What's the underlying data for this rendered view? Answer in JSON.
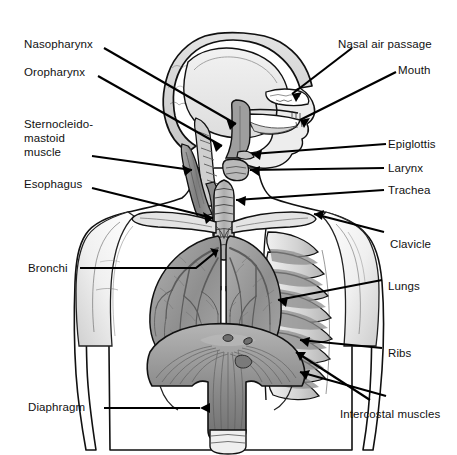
{
  "diagram": {
    "type": "anatomical-illustration",
    "background_color": "#ffffff",
    "line_color": "#000000",
    "width": 457,
    "height": 455
  },
  "labels": {
    "left": [
      {
        "id": "nasopharynx",
        "text": "Nasopharynx",
        "x": 24,
        "y": 38,
        "leader": "diagonal-down-right"
      },
      {
        "id": "oropharynx",
        "text": "Oropharynx",
        "x": 24,
        "y": 66,
        "leader": "diagonal-down-right"
      },
      {
        "id": "sternocleidomastoid",
        "text": "Sternocleido-mastoid muscle",
        "x": 24,
        "y": 117,
        "leader": "horizontal-right",
        "lines": [
          "Sternocleido-",
          "mastoid",
          "muscle"
        ]
      },
      {
        "id": "esophagus",
        "text": "Esophagus",
        "x": 24,
        "y": 178,
        "leader": "horizontal-right"
      },
      {
        "id": "bronchi",
        "text": "Bronchi",
        "x": 28,
        "y": 262,
        "leader": "horizontal-right"
      },
      {
        "id": "diaphragm",
        "text": "Diaphragm",
        "x": 28,
        "y": 401,
        "leader": "horizontal-right"
      }
    ],
    "right": [
      {
        "id": "nasal-air-passage",
        "text": "Nasal air passage",
        "x": 338,
        "y": 38,
        "leader": "diagonal-down-left"
      },
      {
        "id": "mouth",
        "text": "Mouth",
        "x": 398,
        "y": 64,
        "leader": "diagonal-down-left"
      },
      {
        "id": "epiglottis",
        "text": "Epiglottis",
        "x": 388,
        "y": 138,
        "leader": "horizontal-left"
      },
      {
        "id": "larynx",
        "text": "Larynx",
        "x": 388,
        "y": 162,
        "leader": "horizontal-left"
      },
      {
        "id": "trachea",
        "text": "Trachea",
        "x": 388,
        "y": 184,
        "leader": "horizontal-left"
      },
      {
        "id": "clavicle",
        "text": "Clavicle",
        "x": 390,
        "y": 238,
        "leader": "diagonal-up-left"
      },
      {
        "id": "lungs",
        "text": "Lungs",
        "x": 388,
        "y": 280,
        "leader": "horizontal-left"
      },
      {
        "id": "ribs",
        "text": "Ribs",
        "x": 388,
        "y": 347,
        "leader": "horizontal-left"
      },
      {
        "id": "intercostal-muscles",
        "text": "Intercostal muscles",
        "x": 340,
        "y": 408,
        "leader": "diagonal-up-left"
      }
    ]
  },
  "structures": [
    {
      "name": "skull",
      "tone": "#d9d9d9"
    },
    {
      "name": "cranial-cavity",
      "tone": "#e8e8e8"
    },
    {
      "name": "nasal-cavity",
      "tone": "#ffffff"
    },
    {
      "name": "oral-cavity",
      "tone": "#ffffff"
    },
    {
      "name": "pharynx",
      "tone": "#9e9e9e"
    },
    {
      "name": "vertebrae",
      "tone": "#cfcfcf"
    },
    {
      "name": "trachea",
      "tone": "#bdbdbd"
    },
    {
      "name": "esophagus",
      "tone": "#8c8c8c"
    },
    {
      "name": "sternocleidomastoid",
      "tone": "#8f8f8f"
    },
    {
      "name": "clavicle",
      "tone": "#e0e0e0"
    },
    {
      "name": "lung-left",
      "tone": "#9a9a9a"
    },
    {
      "name": "lung-right",
      "tone": "#9a9a9a"
    },
    {
      "name": "bronchial-tree",
      "tone": "#6a6a6a"
    },
    {
      "name": "ribs",
      "tone": "#dcdcdc"
    },
    {
      "name": "intercostal-muscle",
      "tone": "#8a8a8a"
    },
    {
      "name": "diaphragm",
      "tone": "#9c9c9c"
    },
    {
      "name": "body-outline",
      "tone": "#ffffff"
    }
  ]
}
